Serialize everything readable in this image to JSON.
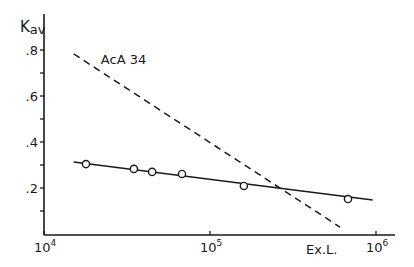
{
  "chart_data": {
    "type": "scatter",
    "title": "",
    "xlabel": "Ex.L.",
    "ylabel_main": "K",
    "ylabel_sub": "av",
    "xscale": "log",
    "xlim": [
      10000,
      1200000
    ],
    "ylim": [
      0,
      0.88
    ],
    "grid": false,
    "x_ticks": [
      {
        "value": 10000,
        "base": "10",
        "exp": "4"
      },
      {
        "value": 100000,
        "base": "10",
        "exp": "5"
      },
      {
        "value": 1000000,
        "base": "10",
        "exp": "6"
      }
    ],
    "y_major_ticks": [
      {
        "value": 0.2,
        "label": ".2"
      },
      {
        "value": 0.4,
        "label": ".4"
      },
      {
        "value": 0.6,
        "label": ".6"
      },
      {
        "value": 0.8,
        "label": ".8"
      }
    ],
    "y_minor_ticks": [
      0.1,
      0.3,
      0.5,
      0.7
    ],
    "series": [
      {
        "name": "data points",
        "marker": "open-circle",
        "points": [
          {
            "x": 17900,
            "y": 0.304
          },
          {
            "x": 34800,
            "y": 0.283
          },
          {
            "x": 44800,
            "y": 0.27
          },
          {
            "x": 67800,
            "y": 0.261
          },
          {
            "x": 160000,
            "y": 0.209
          },
          {
            "x": 678000,
            "y": 0.152
          }
        ]
      },
      {
        "name": "fit line",
        "style": "solid",
        "points": [
          {
            "x": 15100,
            "y": 0.313
          },
          {
            "x": 955000,
            "y": 0.148
          }
        ]
      },
      {
        "name": "AcA 34",
        "style": "dashed",
        "points": [
          {
            "x": 15100,
            "y": 0.783
          },
          {
            "x": 607000,
            "y": 0.03
          }
        ]
      }
    ],
    "annotations": [
      {
        "text": "AcA 34",
        "x": 22000,
        "y": 0.74
      }
    ]
  }
}
